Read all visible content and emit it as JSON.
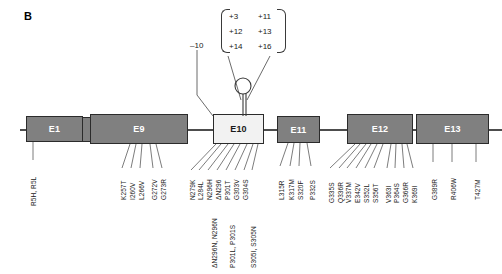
{
  "figure": {
    "panel_letter": "B",
    "type": "gene-exon-mutation-diagram"
  },
  "top_annotations": {
    "single": "–10",
    "group": [
      "+3",
      "+11",
      "+12",
      "+13",
      "+14",
      "+16"
    ]
  },
  "exons": [
    {
      "id": "e1",
      "label": "E1",
      "shade": "dark"
    },
    {
      "id": "e9",
      "label": "E9",
      "shade": "dark"
    },
    {
      "id": "e10",
      "label": "E10",
      "shade": "light"
    },
    {
      "id": "e11",
      "label": "E11",
      "shade": "dark"
    },
    {
      "id": "e12",
      "label": "E12",
      "shade": "dark"
    },
    {
      "id": "e13",
      "label": "E13",
      "shade": "dark"
    }
  ],
  "mutations": {
    "e1": [
      "R5H, R5L"
    ],
    "e9": [
      "K257T",
      "I260V",
      "L266V",
      "G272V",
      "G273R"
    ],
    "e10_upper": [
      "N279K",
      "L284L",
      "N296H",
      "ΔN296",
      "P301T",
      "G303V",
      "G304S"
    ],
    "e10_lower": [
      "ΔN296N, N296N",
      "P301L, P301S",
      "S305I, S305N"
    ],
    "e11": [
      "L315R",
      "K317M",
      "S320F",
      "P332S"
    ],
    "e12": [
      "G335S",
      "Q336R",
      "V337M",
      "E342V",
      "S352L",
      "S356T",
      "V363I",
      "P364S",
      "G366R",
      "K369I"
    ],
    "e13": [
      "G389R",
      "R406W",
      "T427M"
    ]
  },
  "colors": {
    "exon_dark": "#808080",
    "exon_light": "#f2f2f2",
    "stroke": "#2b2b2b",
    "line": "#4d4d4d",
    "text": "#1a1a1a"
  }
}
